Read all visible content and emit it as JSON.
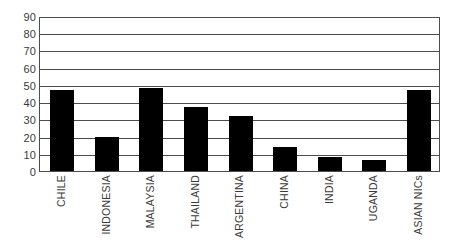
{
  "chart_data": {
    "type": "bar",
    "title": "",
    "subtitle": "",
    "xlabel": "",
    "ylabel": "",
    "categories": [
      "CHILE",
      "INDONESIA",
      "MALAYSIA",
      "THAILAND",
      "ARGENTINA",
      "CHINA",
      "INDIA",
      "UGANDA",
      "ASIAN NICs"
    ],
    "values": [
      47,
      20,
      48,
      37,
      32,
      14,
      8,
      6.5,
      47
    ],
    "ylim": [
      0,
      90
    ],
    "ytick_step": 10,
    "yticks": [
      0,
      10,
      20,
      30,
      40,
      50,
      60,
      70,
      80,
      90
    ],
    "ytick_labels": [
      "0",
      "10",
      "20",
      "30",
      "40",
      "50",
      "60",
      "70",
      "80",
      "90"
    ],
    "grid": true,
    "grid_axis": "y",
    "legend": false,
    "legend_position": "none",
    "bar_color": "#000000",
    "grid_color": "#4d4d4d",
    "axis_color": "#4d4d4d",
    "label_color": "#3a3a3a",
    "background": "#ffffff"
  },
  "axes": {
    "y_axis_name": "y-axis",
    "x_axis_name": "x-axis"
  }
}
